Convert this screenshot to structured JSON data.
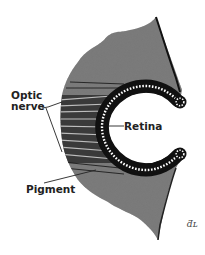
{
  "diagram": {
    "labels": {
      "optic_nerve_line1": "Optic",
      "optic_nerve_line2": "nerve",
      "retina": "Retina",
      "pigment": "Pigment"
    },
    "signature": "ƌʟ",
    "colors": {
      "background": "#ffffff",
      "tissue": "#6e6e6e",
      "outline": "#1a1a1a",
      "retina_beads": "#ffffff",
      "label_text": "#222222"
    }
  }
}
